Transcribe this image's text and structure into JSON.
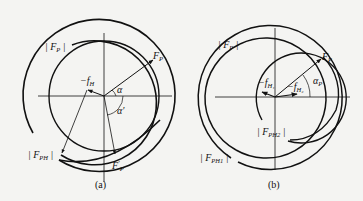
{
  "figure": {
    "panels": [
      {
        "id": "a",
        "caption": "(a)",
        "labels": {
          "fp_mag": {
            "bar_l": "|",
            "main": "F",
            "sub": "P",
            "bar_r": "|"
          },
          "neg_fh": {
            "main": "−f",
            "sub": "H"
          },
          "fp": {
            "main": "F",
            "sub": "P"
          },
          "alpha": "α",
          "alpha_prime": "α′",
          "fph_mag": {
            "bar_l": "|",
            "main": "F",
            "sub": "PH",
            "bar_r": "|"
          },
          "fp_prime": {
            "main": "F",
            "sup": "′",
            "sub": "P"
          }
        }
      },
      {
        "id": "b",
        "caption": "(b)",
        "labels": {
          "fp_mag": {
            "bar_l": "|",
            "main": "F",
            "sub": "P",
            "bar_r": "|"
          },
          "fp": {
            "main": "F",
            "sub": "P"
          },
          "neg_fh1": {
            "main": "−f",
            "sub": "H₁"
          },
          "neg_fh2": {
            "main": "−f",
            "sub": "H₂"
          },
          "alpha_p": {
            "main": "α",
            "sub": "P"
          },
          "fph2_mag": {
            "bar_l": "|",
            "main": "F",
            "sub": "PH2",
            "bar_r": "|"
          },
          "fph1_mag": {
            "bar_l": "|",
            "main": "F",
            "sub": "PH1",
            "bar_r": "|"
          }
        }
      }
    ],
    "colors": {
      "ink": "#111111",
      "background": "#f4f4f2"
    }
  }
}
